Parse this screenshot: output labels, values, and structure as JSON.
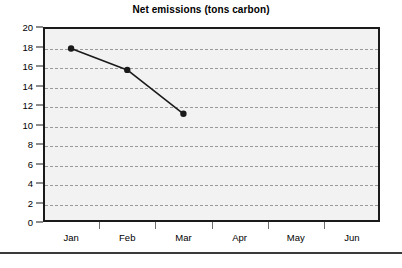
{
  "chart_data": {
    "type": "line",
    "title": "Net emissions (tons carbon)",
    "xlabel": "",
    "ylabel": "",
    "categories": [
      "Jan",
      "Feb",
      "Mar",
      "Apr",
      "May",
      "Jun"
    ],
    "series": [
      {
        "name": "Net emissions",
        "values": [
          17.8,
          15.6,
          11.1,
          null,
          null,
          null
        ]
      }
    ],
    "ylim": [
      0,
      20
    ],
    "ytick_step": 2,
    "ytick_labels": [
      "0",
      "2",
      "4",
      "6",
      "8",
      "10",
      "12",
      "14",
      "16",
      "18",
      "20"
    ],
    "grid": true,
    "grid_axis": "y",
    "grid_style": "dashed",
    "legend": false,
    "marker": "filled-circle",
    "line_color": "#1a1a1a",
    "marker_color": "#1a1a1a",
    "plot_background": "#f2f2f2",
    "grid_color": "#999999",
    "axis_color": "#1a1a1a"
  },
  "figure": {
    "title": "Net emissions (tons carbon)",
    "divider_label": "bottom-rule"
  }
}
